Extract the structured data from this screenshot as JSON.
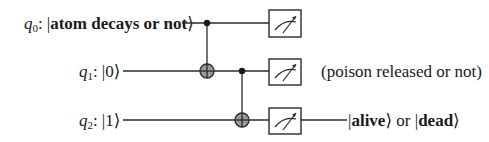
{
  "qubits": [
    {
      "name": "q",
      "sub": "0",
      "colon": ":",
      "ket_open": "|",
      "state": "atom decays or not",
      "state_bold": true,
      "ket_close": "⟩"
    },
    {
      "name": "q",
      "sub": "1",
      "colon": ":",
      "ket_open": "|",
      "state": "0",
      "state_bold": false,
      "ket_close": "⟩"
    },
    {
      "name": "q",
      "sub": "2",
      "colon": ":",
      "ket_open": "|",
      "state": "1",
      "state_bold": false,
      "ket_close": "⟩"
    }
  ],
  "gates": [
    {
      "type": "CNOT",
      "control": "q0",
      "target": "q1"
    },
    {
      "type": "CNOT",
      "control": "q1",
      "target": "q2"
    },
    {
      "type": "measure",
      "qubit": "q0"
    },
    {
      "type": "measure",
      "qubit": "q1"
    },
    {
      "type": "measure",
      "qubit": "q2"
    }
  ],
  "annotations": {
    "q1_note": "(poison released or not)",
    "q2_output": {
      "part1_open": "|",
      "part1_word": "alive",
      "part1_close": "⟩",
      "or": " or ",
      "part2_open": "|",
      "part2_word": "dead",
      "part2_close": "⟩"
    }
  },
  "colors": {
    "line": "#2a2a2a",
    "target_fill": "#9a9a9a",
    "background": "#ffffff"
  }
}
